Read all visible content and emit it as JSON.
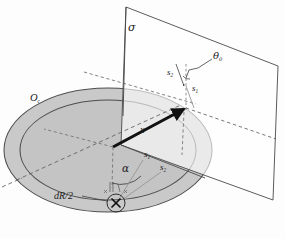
{
  "figure": {
    "background_color": "#fdfdfd",
    "colors": {
      "disk_fill": "#c9c9c9",
      "ring_fill": "#c4c4c4",
      "stroke": "#3a3a3a",
      "plane_stroke": "#4a4a4a",
      "plane_fill": "#ffffff",
      "vector": "#111111",
      "dashed": "#6a6a6a",
      "thin_ray": "#8a8a8a"
    }
  },
  "labels": {
    "plane": {
      "text": "σ",
      "desc": "sigma-plane-label"
    },
    "disk": {
      "base": "O",
      "sub": "c",
      "desc": "oc-disk-label"
    },
    "vector_x": {
      "text": "x",
      "desc": "position-vector-label"
    },
    "alpha": {
      "text": "α",
      "desc": "alpha-angle-label"
    },
    "theta": {
      "base": "θ",
      "sub": "0",
      "desc": "theta-zero-angle-label"
    },
    "dR": {
      "text": "dR/2",
      "desc": "dr-half-label"
    },
    "s1_disk": {
      "base": "s",
      "sub": "1",
      "desc": "s1-label-on-disk"
    },
    "s2_disk": {
      "base": "s",
      "sub": "2",
      "desc": "s2-label-on-disk"
    },
    "s1_plane": {
      "base": "s",
      "sub": "1",
      "desc": "s1-label-on-plane"
    },
    "s2_plane": {
      "base": "s",
      "sub": "2",
      "desc": "s2-label-on-plane"
    }
  },
  "geometry": {
    "outer_ellipse": {
      "cx": 108,
      "cy": 150,
      "rx": 104,
      "ry": 62
    },
    "inner_ellipse": {
      "cx": 108,
      "cy": 150,
      "rx": 88,
      "ry": 50
    },
    "small_circle": {
      "cx": 116,
      "cy": 203,
      "r": 9
    },
    "disk_center": {
      "x": 113,
      "y": 147
    },
    "vector_tip": {
      "x": 186,
      "y": 108
    },
    "plane_corners": [
      {
        "x": 126,
        "y": 7
      },
      {
        "x": 278,
        "y": 66
      },
      {
        "x": 273,
        "y": 200
      },
      {
        "x": 121,
        "y": 145
      }
    ]
  }
}
